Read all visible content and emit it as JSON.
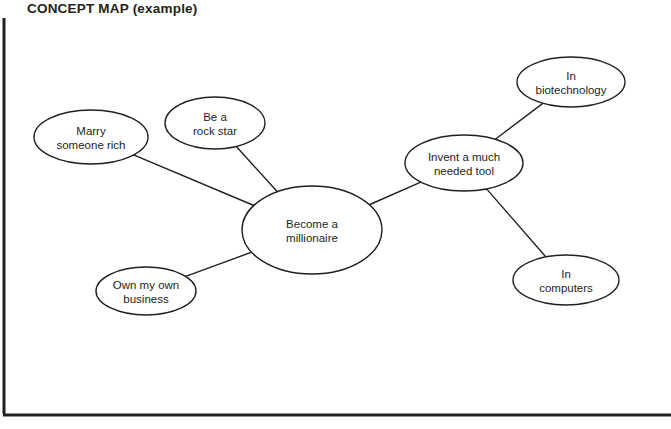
{
  "title": "CONCEPT MAP (example)",
  "colors": {
    "stroke": "#231f20",
    "text": "#231f20",
    "background": "#ffffff",
    "frame": "#231f20"
  },
  "frame": {
    "left_rule_label": "left-border-rule",
    "bottom_rule_label": "bottom-border-rule"
  },
  "chart_data": {
    "type": "diagram",
    "diagram_type": "concept-map",
    "title": "CONCEPT MAP (example)",
    "nodes": [
      {
        "id": "marry",
        "label": "Marry\nsomeone rich",
        "cx": 91,
        "cy": 137,
        "rx": 57,
        "ry": 27
      },
      {
        "id": "rockstar",
        "label": "Be a\nrock star",
        "cx": 215,
        "cy": 123,
        "rx": 50,
        "ry": 26
      },
      {
        "id": "millionaire",
        "label": "Become a\nmillionaire",
        "cx": 312,
        "cy": 230,
        "rx": 70,
        "ry": 44
      },
      {
        "id": "business",
        "label": "Own my own\nbusiness",
        "cx": 146,
        "cy": 291,
        "rx": 50,
        "ry": 24
      },
      {
        "id": "invent",
        "label": "Invent a  much\nneeded  tool",
        "cx": 464,
        "cy": 163,
        "rx": 59,
        "ry": 28
      },
      {
        "id": "biotech",
        "label": "In\nbiotechnology",
        "cx": 571,
        "cy": 82,
        "rx": 54,
        "ry": 25
      },
      {
        "id": "computers",
        "label": "In\ncomputers",
        "cx": 566,
        "cy": 280,
        "rx": 53,
        "ry": 25
      }
    ],
    "edges": [
      {
        "from": "marry",
        "to": "millionaire"
      },
      {
        "from": "rockstar",
        "to": "millionaire"
      },
      {
        "from": "business",
        "to": "millionaire"
      },
      {
        "from": "millionaire",
        "to": "invent"
      },
      {
        "from": "invent",
        "to": "biotech"
      },
      {
        "from": "invent",
        "to": "computers"
      }
    ]
  }
}
